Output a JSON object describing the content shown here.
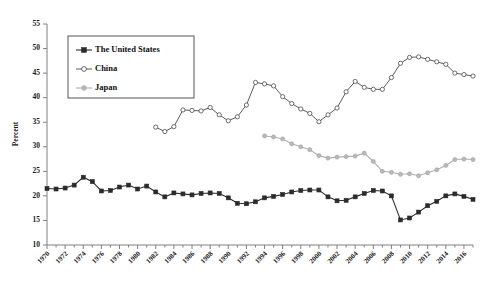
{
  "chart_data": {
    "type": "line",
    "title": "",
    "xlabel": "",
    "ylabel": "Percent",
    "ylim": [
      10,
      55
    ],
    "ytick_step": 5,
    "yticks": [
      10,
      15,
      20,
      25,
      30,
      35,
      40,
      45,
      50,
      55
    ],
    "xlim": [
      1970,
      2017
    ],
    "xticks": [
      1970,
      1972,
      1974,
      1976,
      1978,
      1980,
      1982,
      1984,
      1986,
      1988,
      1990,
      1992,
      1994,
      1996,
      1998,
      2000,
      2002,
      2004,
      2006,
      2008,
      2010,
      2012,
      2014,
      2016
    ],
    "xtick_labels": [
      "1970",
      "1972",
      "1974",
      "1976",
      "1978",
      "1980",
      "1982",
      "1984",
      "1986",
      "1988",
      "1990",
      "1992",
      "1994",
      "1996",
      "1998",
      "2000",
      "2002",
      "2004",
      "2006",
      "2008",
      "2010",
      "2012",
      "2014",
      "2016"
    ],
    "grid": false,
    "legend_position": "upper-left",
    "series": [
      {
        "name": "The United States",
        "marker": "filled-square",
        "color": "#2b2b2b",
        "x": [
          1970,
          1971,
          1972,
          1973,
          1974,
          1975,
          1976,
          1977,
          1978,
          1979,
          1980,
          1981,
          1982,
          1983,
          1984,
          1985,
          1986,
          1987,
          1988,
          1989,
          1990,
          1991,
          1992,
          1993,
          1994,
          1995,
          1996,
          1997,
          1998,
          1999,
          2000,
          2001,
          2002,
          2003,
          2004,
          2005,
          2006,
          2007,
          2008,
          2009,
          2010,
          2011,
          2012,
          2013,
          2014,
          2015,
          2016,
          2017
        ],
        "values": [
          21.5,
          21.4,
          21.6,
          22.2,
          23.8,
          22.9,
          21.0,
          21.1,
          21.8,
          22.2,
          21.4,
          22.0,
          20.8,
          19.8,
          20.6,
          20.4,
          20.2,
          20.5,
          20.6,
          20.5,
          19.6,
          18.5,
          18.4,
          18.8,
          19.6,
          19.9,
          20.3,
          20.8,
          21.1,
          21.2,
          21.2,
          19.8,
          19.0,
          19.1,
          19.8,
          20.5,
          21.1,
          21.0,
          20.0,
          15.1,
          15.5,
          16.7,
          18.0,
          18.9,
          20.0,
          20.4,
          19.9,
          19.3
        ]
      },
      {
        "name": "China",
        "marker": "open-circle",
        "color": "#4a4a4a",
        "x": [
          1982,
          1983,
          1984,
          1985,
          1986,
          1987,
          1988,
          1989,
          1990,
          1991,
          1992,
          1993,
          1994,
          1995,
          1996,
          1997,
          1998,
          1999,
          2000,
          2001,
          2002,
          2003,
          2004,
          2005,
          2006,
          2007,
          2008,
          2009,
          2010,
          2011,
          2012,
          2013,
          2014,
          2015,
          2016,
          2017
        ],
        "values": [
          34.0,
          33.1,
          34.1,
          37.5,
          37.4,
          37.3,
          38.0,
          36.5,
          35.3,
          36.1,
          38.5,
          43.1,
          42.8,
          42.4,
          40.2,
          38.8,
          37.7,
          36.8,
          35.1,
          36.5,
          37.9,
          41.2,
          43.3,
          42.1,
          41.7,
          41.7,
          44.1,
          47.0,
          48.2,
          48.3,
          47.8,
          47.3,
          46.8,
          45.0,
          44.7,
          44.4
        ]
      },
      {
        "name": "Japan",
        "marker": "filled-circle",
        "color": "#b8b8b8",
        "x": [
          1994,
          1995,
          1996,
          1997,
          1998,
          1999,
          2000,
          2001,
          2002,
          2003,
          2004,
          2005,
          2006,
          2007,
          2008,
          2009,
          2010,
          2011,
          2012,
          2013,
          2014,
          2015,
          2016,
          2017
        ],
        "values": [
          32.2,
          32.0,
          31.6,
          30.6,
          30.0,
          29.4,
          28.2,
          27.7,
          27.9,
          28.0,
          28.1,
          28.7,
          27.0,
          25.0,
          24.8,
          24.4,
          24.5,
          24.1,
          24.7,
          25.3,
          26.2,
          27.4,
          27.5,
          27.4
        ]
      }
    ]
  },
  "legend": {
    "items": [
      {
        "label": "The United States"
      },
      {
        "label": "China"
      },
      {
        "label": "Japan"
      }
    ]
  },
  "axis": {
    "y_title": "Percent"
  }
}
